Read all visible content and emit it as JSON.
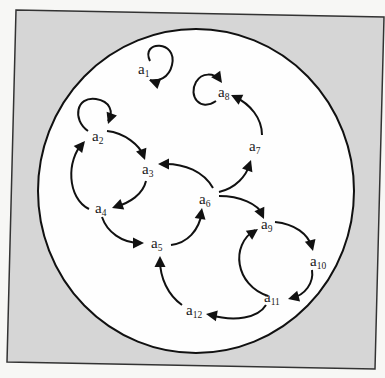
{
  "figure": {
    "background_color": "#d6d6d6",
    "circle_fill": "#fefefe",
    "stroke_color": "#111111",
    "frame": {
      "points": [
        [
          16,
          10
        ],
        [
          384,
          17
        ],
        [
          375,
          369
        ],
        [
          7,
          362
        ]
      ]
    },
    "universe_circle": {
      "cx": 196,
      "cy": 191,
      "rx": 158,
      "ry": 162
    }
  },
  "nodes": [
    {
      "id": "a1",
      "base": "a",
      "sub": "1",
      "x": 138,
      "y": 74
    },
    {
      "id": "a2",
      "base": "a",
      "sub": "2",
      "x": 92,
      "y": 141
    },
    {
      "id": "a3",
      "base": "a",
      "sub": "3",
      "x": 142,
      "y": 174
    },
    {
      "id": "a4",
      "base": "a",
      "sub": "4",
      "x": 95,
      "y": 213
    },
    {
      "id": "a5",
      "base": "a",
      "sub": "5",
      "x": 151,
      "y": 248
    },
    {
      "id": "a6",
      "base": "a",
      "sub": "6",
      "x": 199,
      "y": 204
    },
    {
      "id": "a7",
      "base": "a",
      "sub": "7",
      "x": 249,
      "y": 151
    },
    {
      "id": "a8",
      "base": "a",
      "sub": "8",
      "x": 218,
      "y": 97
    },
    {
      "id": "a9",
      "base": "a",
      "sub": "9",
      "x": 261,
      "y": 229
    },
    {
      "id": "a10",
      "base": "a",
      "sub": "10",
      "x": 310,
      "y": 266
    },
    {
      "id": "a11",
      "base": "a",
      "sub": "11",
      "x": 264,
      "y": 302
    },
    {
      "id": "a12",
      "base": "a",
      "sub": "12",
      "x": 186,
      "y": 315
    }
  ],
  "edges": [
    {
      "from": "a1",
      "to": "a1",
      "path": "M 150 61 C 140 40, 178 40, 172 65 C 169 78, 158 82, 150 80"
    },
    {
      "from": "a2",
      "to": "a2",
      "path": "M 88 131 C 72 120, 76 96, 96 99 C 110 101, 114 112, 108 121"
    },
    {
      "from": "a8",
      "to": "a8",
      "path": "M 216 101 C 200 112, 188 96, 196 82 C 202 72, 214 73, 220 80"
    },
    {
      "from": "a2",
      "to": "a3",
      "path": "M 107 131 C 125 133, 139 145, 144 156"
    },
    {
      "from": "a3",
      "to": "a4",
      "path": "M 146 181 C 143 194, 130 203, 115 207"
    },
    {
      "from": "a4",
      "to": "a2",
      "path": "M 89 209 C 67 198, 66 160, 83 143"
    },
    {
      "from": "a4",
      "to": "a5",
      "path": "M 102 217 C 107 232, 122 243, 140 243"
    },
    {
      "from": "a5",
      "to": "a6",
      "path": "M 171 245 C 187 243, 199 231, 202 212"
    },
    {
      "from": "a6",
      "to": "a3",
      "path": "M 213 188 C 204 172, 185 163, 162 164"
    },
    {
      "from": "a6",
      "to": "a7",
      "path": "M 219 192 C 236 188, 246 176, 250 164"
    },
    {
      "from": "a7",
      "to": "a8",
      "path": "M 262 135 C 262 118, 250 104, 235 97"
    },
    {
      "from": "a6",
      "to": "a9",
      "path": "M 219 196 C 240 196, 258 204, 263 215"
    },
    {
      "from": "a9",
      "to": "a10",
      "path": "M 275 222 C 295 224, 308 234, 312 247"
    },
    {
      "from": "a10",
      "to": "a11",
      "path": "M 312 270 C 314 283, 305 295, 292 298"
    },
    {
      "from": "a11",
      "to": "a9",
      "path": "M 268 296 C 235 285, 230 245, 255 230"
    },
    {
      "from": "a11",
      "to": "a12",
      "path": "M 266 305 C 258 318, 235 322, 210 315"
    },
    {
      "from": "a12",
      "to": "a5",
      "path": "M 182 305 C 168 295, 160 278, 160 260"
    }
  ],
  "arrowheads": [
    {
      "at": "a1",
      "x": 149,
      "y": 80,
      "angle": 200
    },
    {
      "at": "a2",
      "x": 108,
      "y": 124,
      "angle": 110
    },
    {
      "at": "a8",
      "x": 222,
      "y": 83,
      "angle": 55
    },
    {
      "at": "a3",
      "x": 145,
      "y": 160,
      "angle": 70
    },
    {
      "at": "a4",
      "x": 112,
      "y": 208,
      "angle": 160
    },
    {
      "at": "a2",
      "x": 85,
      "y": 141,
      "angle": -50
    },
    {
      "at": "a5",
      "x": 144,
      "y": 243,
      "angle": 0
    },
    {
      "at": "a6",
      "x": 202,
      "y": 208,
      "angle": -80
    },
    {
      "at": "a3",
      "x": 158,
      "y": 164,
      "angle": 180
    },
    {
      "at": "a7",
      "x": 251,
      "y": 160,
      "angle": -70
    },
    {
      "at": "a8",
      "x": 231,
      "y": 95,
      "angle": 205
    },
    {
      "at": "a9",
      "x": 264,
      "y": 219,
      "angle": 65
    },
    {
      "at": "a10",
      "x": 313,
      "y": 251,
      "angle": 75
    },
    {
      "at": "a11",
      "x": 288,
      "y": 299,
      "angle": 165
    },
    {
      "at": "a9",
      "x": 258,
      "y": 229,
      "angle": -35
    },
    {
      "at": "a12",
      "x": 206,
      "y": 314,
      "angle": 190
    },
    {
      "at": "a5",
      "x": 160,
      "y": 256,
      "angle": -90
    }
  ]
}
